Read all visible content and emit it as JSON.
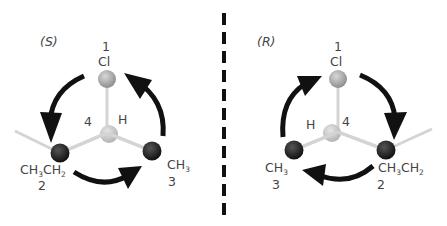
{
  "figure": "Enantiomers of 2-chlorobutane with CIP priorities",
  "colors": {
    "arrow": "#111111",
    "bond": "#d4d4d4",
    "chlorine_atom": "#a8a8a8",
    "carbon_atom": "#1e1e1e",
    "hydrogen_atom": "#c8c8c8",
    "mirror_line": "#111111",
    "label": "#444444"
  },
  "left": {
    "configuration": "(S)",
    "rotation": "counterclockwise",
    "substituents": [
      {
        "priority": "1",
        "group": "Cl"
      },
      {
        "priority": "2",
        "group": "CH3CH2"
      },
      {
        "priority": "3",
        "group": "CH3"
      },
      {
        "priority": "4",
        "group": "H"
      }
    ]
  },
  "right": {
    "configuration": "(R)",
    "rotation": "clockwise",
    "substituents": [
      {
        "priority": "1",
        "group": "Cl"
      },
      {
        "priority": "2",
        "group": "CH3CH2"
      },
      {
        "priority": "3",
        "group": "CH3"
      },
      {
        "priority": "4",
        "group": "H"
      }
    ]
  },
  "labels": {
    "S": "(S)",
    "R": "(R)",
    "p1": "1",
    "p2": "2",
    "p3": "3",
    "p4": "4",
    "Cl": "Cl",
    "H": "H",
    "CH": "CH",
    "sub3": "3",
    "sub2": "2"
  }
}
